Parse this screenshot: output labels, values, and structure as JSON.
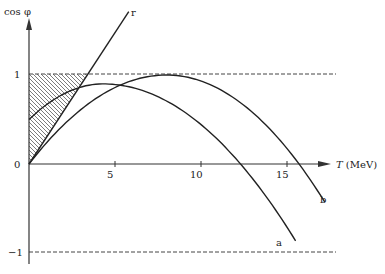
{
  "diagram": {
    "y_axis_label": "cos φ",
    "x_axis_label": "T (MeV)",
    "x_axis_label_var": "T",
    "x_axis_label_unit": "(MeV)",
    "y_ticks": [
      {
        "value": 1,
        "label": "1"
      },
      {
        "value": 0,
        "label": "0"
      },
      {
        "value": -1,
        "label": "−1"
      }
    ],
    "x_ticks": [
      {
        "value": 5,
        "label": "5"
      },
      {
        "value": 10,
        "label": "10"
      },
      {
        "value": 15,
        "label": "15"
      }
    ],
    "x_range": [
      0,
      17.5
    ],
    "y_range": [
      -1.1,
      1.7
    ],
    "reference_lines": [
      1,
      -1
    ],
    "curves": {
      "r": {
        "label": "r",
        "description": "straight line through origin",
        "slope_per_mev": 0.295,
        "t_end": 5.8
      },
      "a": {
        "label": "a",
        "start_value": 0.5,
        "peak_t": 4.3,
        "peak_value": 0.9,
        "zero_t": 12.3,
        "t_end": 15.5
      },
      "b": {
        "label": "b",
        "start_value": 0.0,
        "peak_t": 8.0,
        "peak_value": 1.0,
        "zero_t": 15.7,
        "t_end": 17.2
      }
    },
    "hatched_region": "area between cos φ axis, line r and cos φ = 1"
  }
}
